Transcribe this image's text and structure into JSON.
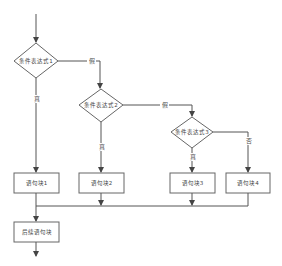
{
  "diagram": {
    "type": "flowchart",
    "nodes": {
      "cond1": {
        "label": "条件表达式1",
        "shape": "diamond"
      },
      "cond2": {
        "label": "条件表达式2",
        "shape": "diamond"
      },
      "cond3": {
        "label": "条件表达式3",
        "shape": "diamond"
      },
      "block1": {
        "label": "语句块1",
        "shape": "rect"
      },
      "block2": {
        "label": "语句块2",
        "shape": "rect"
      },
      "block3": {
        "label": "语句块3",
        "shape": "rect"
      },
      "block4": {
        "label": "语句块4",
        "shape": "rect"
      },
      "after": {
        "label": "后续语句块",
        "shape": "rect"
      }
    },
    "edge_labels": {
      "true": "真",
      "false": "假"
    },
    "edges": [
      {
        "from": "start",
        "to": "cond1"
      },
      {
        "from": "cond1",
        "to": "block1",
        "label": "真"
      },
      {
        "from": "cond1",
        "to": "cond2",
        "label": "假"
      },
      {
        "from": "cond2",
        "to": "block2",
        "label": "真"
      },
      {
        "from": "cond2",
        "to": "cond3",
        "label": "假"
      },
      {
        "from": "cond3",
        "to": "block3",
        "label": "真"
      },
      {
        "from": "cond3",
        "to": "block4",
        "label": "否"
      },
      {
        "from": "block1",
        "to": "after"
      },
      {
        "from": "block2",
        "to": "after"
      },
      {
        "from": "block3",
        "to": "after"
      },
      {
        "from": "block4",
        "to": "after"
      },
      {
        "from": "after",
        "to": "end"
      }
    ],
    "labels": {
      "c1_true": "真",
      "c1_false": "假",
      "c2_true": "真",
      "c2_false": "假",
      "c3_true": "真",
      "c3_false": "否"
    },
    "colors": {
      "line": "#555555",
      "shape_border": "#666666",
      "background": "#ffffff"
    }
  }
}
